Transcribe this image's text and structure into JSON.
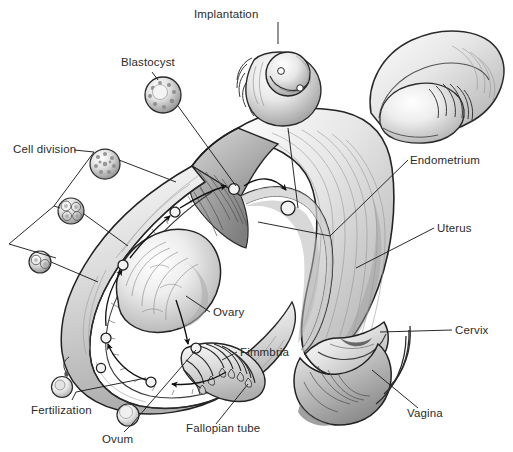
{
  "figure": {
    "style": "grayscale pencil medical illustration",
    "background_color": "#ffffff",
    "ink_color": "#2b2b2b",
    "line_color": "#1a1a1a",
    "width": 513,
    "height": 452
  },
  "labels": [
    {
      "id": "implantation",
      "text": "Implantation",
      "x": 194,
      "y": 8,
      "align": "left"
    },
    {
      "id": "blastocyst",
      "text": "Blastocyst",
      "x": 121,
      "y": 56,
      "align": "left"
    },
    {
      "id": "cell_division",
      "text": "Cell division",
      "x": 13,
      "y": 143,
      "align": "left"
    },
    {
      "id": "endometrium",
      "text": "Endometrium",
      "x": 410,
      "y": 154,
      "align": "left"
    },
    {
      "id": "uterus",
      "text": "Uterus",
      "x": 437,
      "y": 222,
      "align": "left"
    },
    {
      "id": "ovary",
      "text": "Ovary",
      "x": 213,
      "y": 306,
      "align": "left"
    },
    {
      "id": "cervix",
      "text": "Cervix",
      "x": 455,
      "y": 324,
      "align": "left"
    },
    {
      "id": "fimmbria",
      "text": "Fimmbria",
      "x": 240,
      "y": 346,
      "align": "left"
    },
    {
      "id": "fertilization",
      "text": "Fertilization",
      "x": 31,
      "y": 404,
      "align": "left"
    },
    {
      "id": "vagina",
      "text": "Vagina",
      "x": 407,
      "y": 407,
      "align": "left"
    },
    {
      "id": "fallopian_tube",
      "text": "Fallopian tube",
      "x": 186,
      "y": 422,
      "align": "left"
    },
    {
      "id": "ovum",
      "text": "Ovum",
      "x": 102,
      "y": 433,
      "align": "left"
    }
  ],
  "structures": [
    {
      "id": "uterus-body",
      "name": "uterus"
    },
    {
      "id": "endometrium-lining",
      "name": "endometrium"
    },
    {
      "id": "cervix-region",
      "name": "cervix"
    },
    {
      "id": "vagina-region",
      "name": "vagina"
    },
    {
      "id": "ovary-left",
      "name": "ovary"
    },
    {
      "id": "fallopian-tube",
      "name": "fallopian-tube"
    },
    {
      "id": "fimbriae",
      "name": "fimbriae"
    },
    {
      "id": "ovary-right",
      "name": "right-ovary-and-tube"
    },
    {
      "id": "implantation-inset",
      "name": "implantation-inset"
    }
  ],
  "stages": [
    {
      "id": "ovum",
      "name": "ovum",
      "cx": 128,
      "cy": 415,
      "r": 11
    },
    {
      "id": "fertilized",
      "name": "fertilized-ovum",
      "cx": 62,
      "cy": 387,
      "r": 10
    },
    {
      "id": "cell-2",
      "name": "two-cell-stage",
      "cx": 40,
      "cy": 262,
      "r": 11
    },
    {
      "id": "cell-4",
      "name": "four-cell-stage",
      "cx": 71,
      "cy": 211,
      "r": 13
    },
    {
      "id": "morula",
      "name": "morula",
      "cx": 105,
      "cy": 164,
      "r": 15
    },
    {
      "id": "blastocyst",
      "name": "blastocyst",
      "cx": 163,
      "cy": 95,
      "r": 18
    }
  ]
}
